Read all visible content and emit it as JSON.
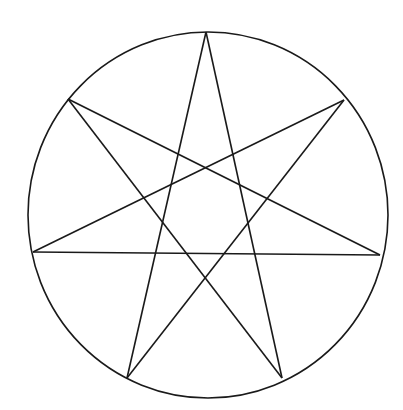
{
  "diagram": {
    "type": "heptagram-in-circle",
    "stroke_color": "#1a1a1a",
    "background": "#ffffff",
    "circle": {
      "cx": 208,
      "cy": 215,
      "rx": 180,
      "ry": 183
    },
    "vertices": {
      "top": [
        206,
        32
      ],
      "upper_left": [
        68,
        99
      ],
      "upper_right": [
        344,
        100
      ],
      "left": [
        33,
        252
      ],
      "right": [
        380,
        255
      ],
      "bottom_left": [
        127,
        378
      ],
      "bottom_right": [
        282,
        378
      ]
    },
    "edges": [
      [
        "top",
        "bottom_left"
      ],
      [
        "top",
        "bottom_right"
      ],
      [
        "upper_left",
        "right"
      ],
      [
        "upper_left",
        "bottom_right"
      ],
      [
        "upper_right",
        "left"
      ],
      [
        "upper_right",
        "bottom_left"
      ],
      [
        "left",
        "right"
      ]
    ]
  }
}
